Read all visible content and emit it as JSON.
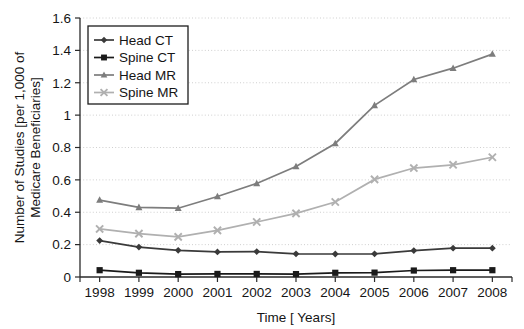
{
  "chart_data": {
    "type": "line",
    "title": "",
    "xlabel": "Time [ Years]",
    "ylabel": "Number of Studies [per 1,000 of Medicare Beneficiaries]",
    "ylabel_line1": "Number of Studies [per 1,000 of",
    "ylabel_line2": "Medicare Beneficiaries]",
    "categories": [
      "1998",
      "1999",
      "2000",
      "2001",
      "2002",
      "2003",
      "2004",
      "2005",
      "2006",
      "2007",
      "2008"
    ],
    "x": [
      1998,
      1999,
      2000,
      2001,
      2002,
      2003,
      2004,
      2005,
      2006,
      2007,
      2008
    ],
    "xlim": [
      1997.5,
      2008.5
    ],
    "ylim": [
      0,
      1.6
    ],
    "yticks": [
      0,
      0.2,
      0.4,
      0.6,
      0.8,
      1.0,
      1.2,
      1.4,
      1.6
    ],
    "ytick_labels": [
      "0",
      "0.2",
      "0.4",
      "0.6",
      "0.8",
      "1",
      "1.2",
      "1.4",
      "1.6"
    ],
    "grid": "horizontal-dotted",
    "legend_position": "top-left-inside",
    "series": [
      {
        "name": "Head CT",
        "marker": "diamond",
        "color": "#3a3a3a",
        "values": [
          0.225,
          0.185,
          0.165,
          0.155,
          0.157,
          0.143,
          0.142,
          0.143,
          0.163,
          0.178,
          0.178
        ]
      },
      {
        "name": "Spine CT",
        "marker": "square",
        "color": "#1a1a1a",
        "values": [
          0.042,
          0.026,
          0.018,
          0.019,
          0.019,
          0.018,
          0.026,
          0.027,
          0.04,
          0.042,
          0.042
        ]
      },
      {
        "name": "Head MR",
        "marker": "triangle",
        "color": "#7d7d7d",
        "values": [
          0.475,
          0.43,
          0.425,
          0.497,
          0.578,
          0.683,
          0.825,
          1.06,
          1.22,
          1.29,
          1.377
        ]
      },
      {
        "name": "Spine MR",
        "marker": "x",
        "color": "#b0b0b0",
        "values": [
          0.297,
          0.268,
          0.248,
          0.288,
          0.34,
          0.393,
          0.463,
          0.603,
          0.673,
          0.693,
          0.74
        ]
      }
    ]
  }
}
